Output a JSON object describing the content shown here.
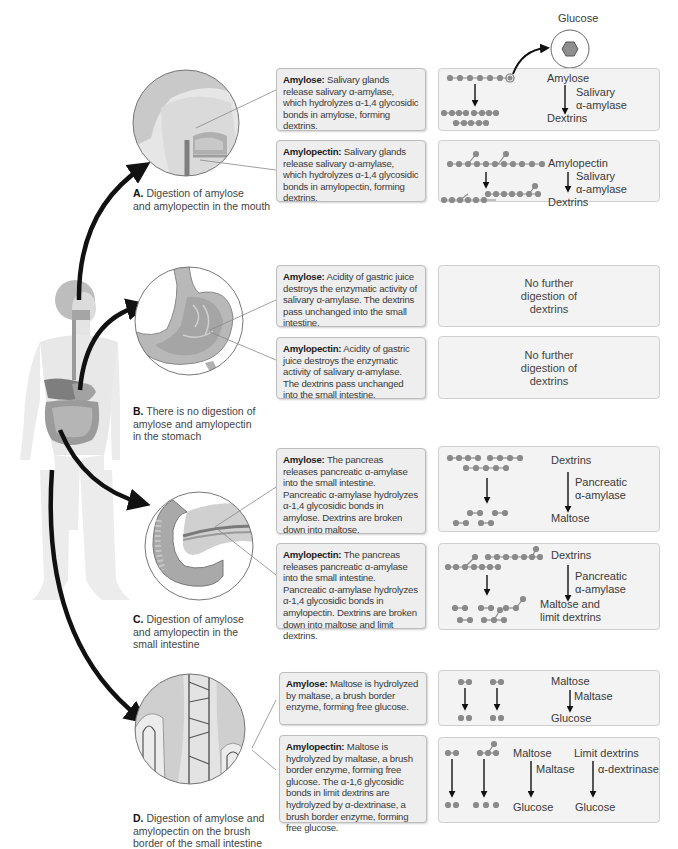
{
  "glucose_label": "Glucose",
  "colors": {
    "textbox_bg": "#eeeeee",
    "diagram_bg": "#f3f3f3",
    "glucose_unit": "#8a8a8a",
    "arrow": "#111111"
  },
  "sections": [
    {
      "id": "A",
      "caption_letter": "A.",
      "caption_text": "Digestion of amylose and amylopectin in the mouth",
      "caption_lines": [
        "Digestion of amylose",
        "and amylopectin in the mouth"
      ],
      "organ_icon": "head-mouth-illustration",
      "amylose": {
        "term": "Amylose:",
        "text": "Salivary glands release salivary α-amylase, which hydrolyzes α-1,4 glycosidic bonds in amylose, forming dextrins.",
        "diagram": {
          "start": "Amylose",
          "enzyme": "Salivary α-amylase",
          "enzyme_lines": [
            "Salivary",
            "α-amylase"
          ],
          "end": "Dextrins"
        }
      },
      "amylopectin": {
        "term": "Amylopectin:",
        "text": "Salivary glands release salivary α-amylase, which hydrolyzes α-1,4 glycosidic bonds in amylopectin, forming dextrins.",
        "diagram": {
          "start": "Amylopectin",
          "enzyme": "Salivary α-amylase",
          "enzyme_lines": [
            "Salivary",
            "α-amylase"
          ],
          "end": "Dextrins"
        }
      }
    },
    {
      "id": "B",
      "caption_letter": "B.",
      "caption_text": "There is no digestion of amylose and amylopectin in the stomach",
      "caption_lines": [
        "There is no digestion of",
        "amylose and amylopectin",
        "in the stomach"
      ],
      "organ_icon": "stomach-illustration",
      "amylose": {
        "term": "Amylose:",
        "text": "Acidity of gastric juice destroys the enzymatic activity of salivary α-amylase. The dextrins pass unchanged into the small intestine.",
        "diagram": {
          "note_lines": [
            "No further",
            "digestion of",
            "dextrins"
          ]
        }
      },
      "amylopectin": {
        "term": "Amylopectin:",
        "text": "Acidity of gastric juice destroys the enzymatic activity of salivary α-amylase. The dextrins pass unchanged into the small intestine.",
        "diagram": {
          "note_lines": [
            "No further",
            "digestion of",
            "dextrins"
          ]
        }
      }
    },
    {
      "id": "C",
      "caption_letter": "C.",
      "caption_text": "Digestion of amylose and amylopectin in the small intestine",
      "caption_lines": [
        "Digestion of amylose",
        "and amylopectin in the",
        "small intestine"
      ],
      "organ_icon": "pancreas-duodenum-illustration",
      "amylose": {
        "term": "Amylose:",
        "text": "The pancreas releases pancreatic α-amylase into the small intestine. Pancreatic α-amylase hydrolyzes α-1,4 glycosidic bonds in amylose. Dextrins are broken down into maltose.",
        "diagram": {
          "start": "Dextrins",
          "enzyme": "Pancreatic α-amylase",
          "enzyme_lines": [
            "Pancreatic",
            "α-amylase"
          ],
          "end": "Maltose"
        }
      },
      "amylopectin": {
        "term": "Amylopectin:",
        "text": "The pancreas releases pancreatic α-amylase into the small intestine. Pancreatic α-amylase hydrolyzes α-1,4 glycosidic bonds in amylopectin. Dextrins are broken down into maltose and limit dextrins.",
        "diagram": {
          "start": "Dextrins",
          "enzyme": "Pancreatic α-amylase",
          "enzyme_lines": [
            "Pancreatic",
            "α-amylase"
          ],
          "end_lines": [
            "Maltose and",
            "limit dextrins"
          ]
        }
      }
    },
    {
      "id": "D",
      "caption_letter": "D.",
      "caption_text": "Digestion of amylose and amylopectin on the brush border of the small intestine",
      "caption_lines": [
        "Digestion of amylose and",
        "amylopectin on the brush",
        "border of the small intestine"
      ],
      "organ_icon": "intestinal-villi-illustration",
      "amylose": {
        "term": "Amylose:",
        "text": "Maltose is hydrolyzed by maltase, a brush border enzyme, forming free glucose.",
        "diagram": {
          "start": "Maltose",
          "enzyme": "Maltase",
          "end": "Glucose"
        }
      },
      "amylopectin": {
        "term": "Amylopectin:",
        "text": "Maltose is hydrolyzed by maltase, a brush border enzyme, forming free glucose. The α-1,6 glycosidic bonds in limit dextrins are hydrolyzed by α-dextrinase, a brush border enzyme, forming free glucose.",
        "diagram": {
          "left": {
            "start": "Maltose",
            "enzyme": "Maltase",
            "end": "Glucose"
          },
          "right": {
            "start": "Limit dextrins",
            "enzyme": "α-dextrinase",
            "end": "Glucose"
          }
        }
      }
    }
  ]
}
